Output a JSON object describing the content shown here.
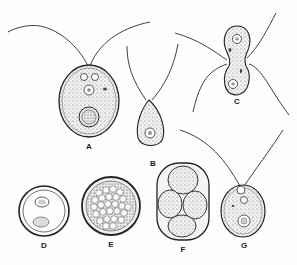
{
  "figure": {
    "panels": [
      {
        "id": "A",
        "label": "A",
        "x": 89,
        "y": 142
      },
      {
        "id": "B",
        "label": "B",
        "x": 153,
        "y": 161
      },
      {
        "id": "C",
        "label": "C",
        "x": 238,
        "y": 100
      },
      {
        "id": "D",
        "label": "D",
        "x": 44,
        "y": 243
      },
      {
        "id": "E",
        "label": "E",
        "x": 111,
        "y": 243
      },
      {
        "id": "F",
        "label": "F",
        "x": 183,
        "y": 247
      },
      {
        "id": "G",
        "label": "G",
        "x": 244,
        "y": 243
      }
    ],
    "colors": {
      "ink": "#222222",
      "cytoplasm": "#f1f1f1",
      "background": "#fdfdfd"
    }
  }
}
